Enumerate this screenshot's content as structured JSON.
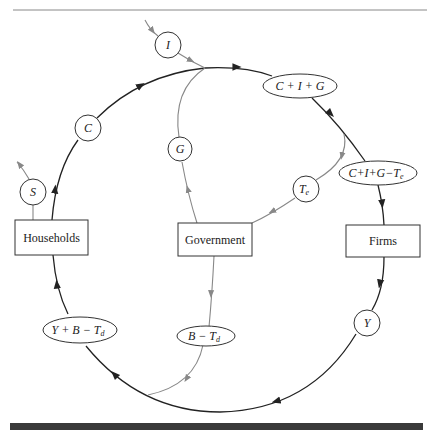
{
  "diagram": {
    "type": "circular-flow",
    "sectors": {
      "households": "Households",
      "government": "Government",
      "firms": "Firms"
    },
    "flows": {
      "investment": "I",
      "consumption": "C",
      "savings": "S",
      "government_spending": "G",
      "indirect_taxes": "T",
      "indirect_taxes_sub": "e",
      "income": "Y",
      "total_spending": "C + I + G",
      "spending_net_indirect_tax_main": "C+I+G−T",
      "spending_net_indirect_tax_sub": "e",
      "disposable_income_main": "Y + B − T",
      "disposable_income_sub": "d",
      "transfers_net_direct_tax_main": "B − T",
      "transfers_net_direct_tax_sub": "d"
    },
    "colors": {
      "main_flow": "#222222",
      "government_flow": "#888888",
      "bottom_bar": "#3a3a3a"
    }
  }
}
